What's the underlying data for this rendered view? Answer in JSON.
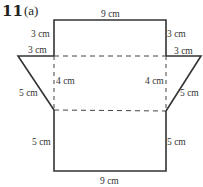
{
  "question": {
    "number": "11",
    "part": "(a)"
  },
  "labels": {
    "top_width": "9 cm",
    "top_left_height": "3 cm",
    "top_right_height": "3 cm",
    "left_flap_top": "3 cm",
    "right_flap_top": "3 cm",
    "left_middle": "4 cm",
    "right_middle": "4 cm",
    "left_slant": "5 cm",
    "right_slant": "5 cm",
    "bottom_left_height": "5 cm",
    "bottom_right_height": "5 cm",
    "bottom_width": "9 cm"
  },
  "colors": {
    "line": "#333333",
    "text": "#333333"
  }
}
